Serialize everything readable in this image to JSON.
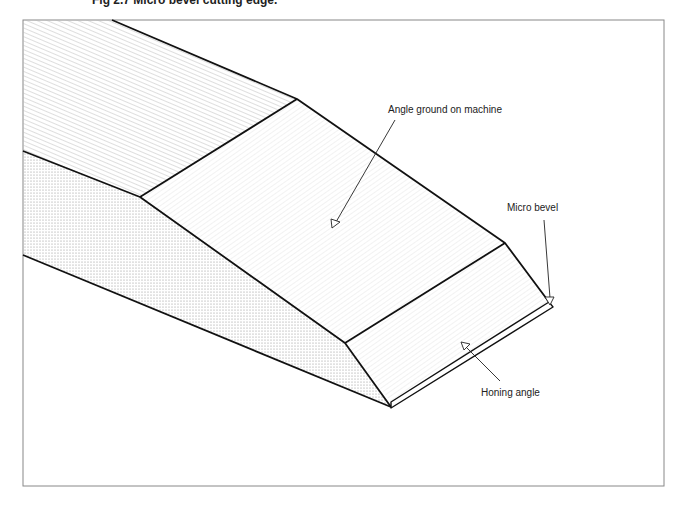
{
  "figure": {
    "caption": "Fig 2.7 Micro bevel cutting edge."
  },
  "labels": {
    "angle_ground": "Angle ground on machine",
    "micro_bevel": "Micro bevel",
    "honing_angle": "Honing angle"
  },
  "regions": [
    {
      "name": "blade-back-face",
      "pattern": "diagonal-hatch"
    },
    {
      "name": "blade-side-face",
      "pattern": "dots"
    },
    {
      "name": "ground-bevel-face",
      "pattern": "fine-hatch"
    },
    {
      "name": "honed-bevel-face",
      "pattern": "fine-hatch"
    },
    {
      "name": "micro-bevel-edge",
      "pattern": "none"
    }
  ],
  "colors": {
    "stroke": "#111111",
    "frame": "#888888",
    "hatch": "#b8b8b8",
    "dots": "#9a9a9a"
  }
}
